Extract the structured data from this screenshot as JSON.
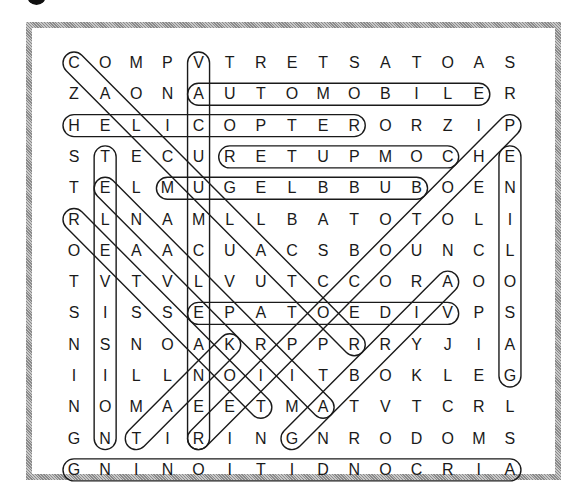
{
  "puzzle": {
    "type": "word-search",
    "columns": 15,
    "rows": 14,
    "grid": [
      "COMPVTRETSATOAS",
      "ZAONAUTOMOBILER",
      "HELICOPTERORZIP",
      "STECURETUPMOCHE",
      "TELMUGELBBUBOEN",
      "RLNAMLLBATOTOLI",
      "OEAACUACSBOUNCL",
      "TVTVLVUTCCORAOO",
      "SISSEPATOEDIVPS",
      "NSNOAKRPPRRYJIA",
      "IILLNOIITBOKLEG",
      "NOMAEETMATVTCRL",
      "GNTIRINGNRODOMS",
      "GNINOITIDNOCRIA"
    ],
    "found_words": [
      {
        "word": "CALCULATOR",
        "start": [
          1,
          1
        ],
        "end": [
          10,
          10
        ]
      },
      {
        "word": "VACUUM CLEANER",
        "start": [
          1,
          5
        ],
        "end": [
          13,
          5
        ]
      },
      {
        "word": "AUTOMOBILE",
        "start": [
          2,
          5
        ],
        "end": [
          2,
          14
        ]
      },
      {
        "word": "HELICOPTER",
        "start": [
          3,
          1
        ],
        "end": [
          3,
          10
        ]
      },
      {
        "word": "COMPUTER",
        "start": [
          4,
          13
        ],
        "end": [
          4,
          6
        ]
      },
      {
        "word": "BUBBLEGUM",
        "start": [
          5,
          12
        ],
        "end": [
          5,
          4
        ]
      },
      {
        "word": "TELEVISION",
        "start": [
          4,
          2
        ],
        "end": [
          13,
          2
        ]
      },
      {
        "word": "GASOLINE",
        "start": [
          11,
          15
        ],
        "end": [
          4,
          15
        ]
      },
      {
        "word": "PHOTOCOPIER",
        "start": [
          3,
          15
        ],
        "end": [
          13,
          5
        ]
      },
      {
        "word": "VIDEOTAPE",
        "start": [
          9,
          13
        ],
        "end": [
          9,
          5
        ]
      },
      {
        "word": "AIRPLANE",
        "start": [
          12,
          9
        ],
        "end": [
          5,
          2
        ]
      },
      {
        "word": "TOASTER",
        "start": [
          12,
          7
        ],
        "end": [
          6,
          1
        ]
      },
      {
        "word": "AIRBAG",
        "start": [
          8,
          13
        ],
        "end": [
          13,
          8
        ]
      },
      {
        "word": "TANK",
        "start": [
          13,
          3
        ],
        "end": [
          10,
          6
        ]
      },
      {
        "word": "AIR CONDITIONING",
        "start": [
          14,
          15
        ],
        "end": [
          14,
          1
        ]
      }
    ]
  }
}
